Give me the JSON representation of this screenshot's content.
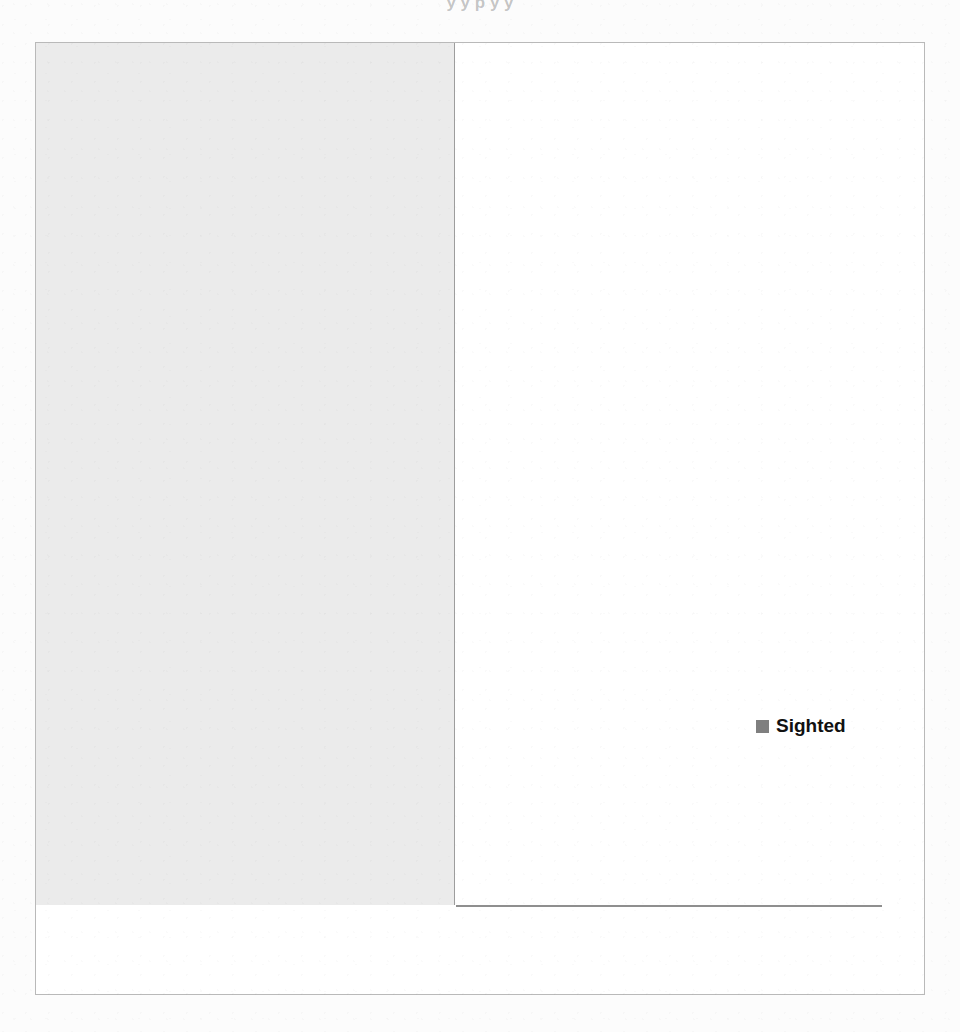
{
  "title_remnant": "y  y  p   y                                          y",
  "colors": {
    "bar": "#808080",
    "legend_swatch": "#7f7f7f",
    "label_panel": "#ebebeb",
    "gridline": "#a8a8a8",
    "axis": "#8f8f8f",
    "frame": "#b9b9b9",
    "text": "#111111"
  },
  "legend": {
    "swatch_name": "legend-color-swatch",
    "entries": [
      {
        "label": "Sighted",
        "color": "#7f7f7f"
      }
    ]
  },
  "axis": {
    "x_ticks": [
      "0%",
      "20%",
      "40%",
      "60%",
      "80%",
      "100%"
    ],
    "x_min": 0,
    "x_max": 100
  },
  "chart_data": {
    "type": "bar",
    "orientation": "horizontal",
    "title": "",
    "subtitle": "",
    "xlabel": "",
    "ylabel": "",
    "xlim": [
      0,
      100
    ],
    "x_tick_labels": [
      "0%",
      "20%",
      "40%",
      "60%",
      "80%",
      "100%"
    ],
    "x_tick_values": [
      0,
      20,
      40,
      60,
      80,
      100
    ],
    "grid": "vertical",
    "legend_position": "inside-right",
    "value_suffix": "%",
    "legend": [
      "Sighted"
    ],
    "categories": [
      "You can better locate the main topics",
      "You can easily recognise the points of a text",
      "You can easier distinguish a piece of text inside the whole text",
      "You can easier locate the information you are looking for",
      "You recall easier what you have read",
      "You can better navigate in a text",
      "You can better comprehend the text",
      "The reading rate is reduced",
      "Diverts attention from the content of the text",
      "Reading becomes easier",
      "The writing becomes hard to discover",
      "You can easier comprehend the book"
    ],
    "series": [
      {
        "name": "Sighted",
        "values": [
          91,
          72,
          72,
          68,
          66,
          57,
          53,
          6,
          6,
          4,
          4,
          2
        ],
        "labels": [
          "91%",
          "72%",
          "72%",
          "68%",
          "66%",
          "57%",
          "53%",
          "6%",
          "6%",
          "4%",
          "4%",
          "2%"
        ],
        "color": "#808080"
      }
    ]
  },
  "rows": [
    {
      "label_lines": [
        "You can better locate the main topics"
      ],
      "value": 91,
      "value_label": "91%"
    },
    {
      "label_lines": [
        "You can easily recognise the points of",
        "a text"
      ],
      "value": 72,
      "value_label": "72%"
    },
    {
      "label_lines": [
        "You can easier distinguish a piece of",
        "text inside the whole text"
      ],
      "value": 72,
      "value_label": "72%"
    },
    {
      "label_lines": [
        "You can easier locate the information",
        "you are looking for"
      ],
      "value": 68,
      "value_label": "68%"
    },
    {
      "label_lines": [
        "You recall easier what you have read"
      ],
      "value": 66,
      "value_label": "66%"
    },
    {
      "label_lines": [
        "You can better navigate in a text"
      ],
      "value": 57,
      "value_label": "57%"
    },
    {
      "label_lines": [
        "You can better comprehend the text"
      ],
      "value": 53,
      "value_label": "53%"
    },
    {
      "label_lines": [
        "The reading rate is reduced"
      ],
      "value": 6,
      "value_label": "6%"
    },
    {
      "label_lines": [
        "Diverts attention from the content of",
        "the text"
      ],
      "value": 6,
      "value_label": "6%"
    },
    {
      "label_lines": [
        "Reading becomes easier"
      ],
      "value": 4,
      "value_label": "4%"
    },
    {
      "label_lines": [
        "The writing becomes hard to discover"
      ],
      "value": 4,
      "value_label": "4%"
    },
    {
      "label_lines": [
        "You can easier comprehend the book"
      ],
      "value": 2,
      "value_label": "2%"
    }
  ]
}
